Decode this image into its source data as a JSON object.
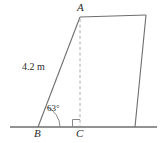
{
  "figure": {
    "type": "geometry-diagram",
    "colors": {
      "line": "#6e6e6e",
      "baseline": "#6e6e6e",
      "dashed": "#a8a8a8",
      "text": "#2b2b2b",
      "background": "#ffffff"
    },
    "vertices": {
      "A": {
        "label": "A",
        "x": 80,
        "y": 17
      },
      "B": {
        "label": "B",
        "x": 38,
        "y": 127
      },
      "C": {
        "label": "C",
        "x": 80,
        "y": 127
      },
      "top_right": {
        "x": 146,
        "y": 15
      },
      "bottom_right": {
        "x": 135,
        "y": 127
      }
    },
    "labels": {
      "side_BA": "4.2 m",
      "angle_B": "63°",
      "vertex_A": "A",
      "vertex_B": "B",
      "vertex_C": "C"
    },
    "baseline": {
      "x1": 10,
      "x2": 157,
      "y": 127
    },
    "markers": {
      "right_angle_at": "C",
      "angle_arc_at": "B"
    }
  }
}
